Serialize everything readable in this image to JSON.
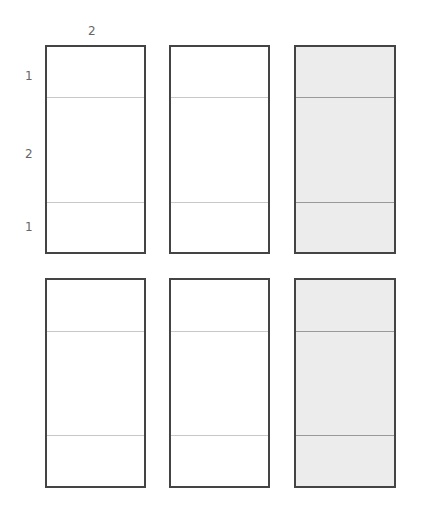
{
  "labels": {
    "width": "2",
    "heights": [
      "1",
      "2",
      "1"
    ]
  },
  "panels": [
    {
      "row": 1,
      "col": 1,
      "shaded": false
    },
    {
      "row": 1,
      "col": 2,
      "shaded": false
    },
    {
      "row": 1,
      "col": 3,
      "shaded": true
    },
    {
      "row": 2,
      "col": 1,
      "shaded": false
    },
    {
      "row": 2,
      "col": 2,
      "shaded": false
    },
    {
      "row": 2,
      "col": 3,
      "shaded": true
    }
  ],
  "colors": {
    "border": "#444444",
    "shade": "#ececec",
    "divider": "#c8c8c8"
  }
}
